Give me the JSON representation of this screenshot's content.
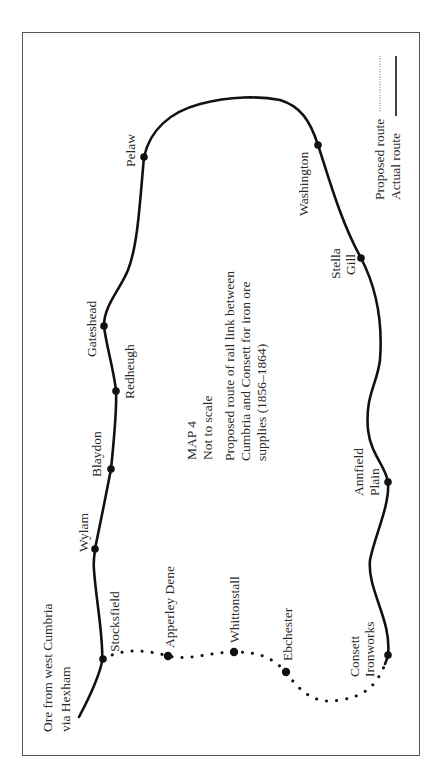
{
  "map": {
    "title": "MAP 4",
    "scale_note": "Not to scale",
    "caption_lines": [
      "Proposed route of rail link between",
      "Cumbria and Consett for iron ore",
      "supplies (1856–1864)"
    ],
    "origin_note_lines": [
      "Ore from west Cumbria",
      "via Hexham"
    ],
    "legend": {
      "proposed_label": "Proposed route",
      "actual_label": "Actual route"
    },
    "colors": {
      "route": "#111111",
      "frame": "#555555",
      "text": "#2a2a2a",
      "background": "#ffffff"
    },
    "stations": [
      {
        "name": "Stocksfield",
        "route": "actual/proposed junction"
      },
      {
        "name": "Wylam",
        "route": "actual"
      },
      {
        "name": "Blaydon",
        "route": "actual"
      },
      {
        "name": "Redheugh",
        "route": "actual"
      },
      {
        "name": "Gateshead",
        "route": "actual"
      },
      {
        "name": "Pelaw",
        "route": "actual"
      },
      {
        "name": "Washington",
        "route": "actual"
      },
      {
        "name": "Stella Gill",
        "route": "actual"
      },
      {
        "name": "Annfield Plain",
        "route": "actual"
      },
      {
        "name": "Consett Ironworks",
        "route": "actual/proposed junction"
      },
      {
        "name": "Apperley Dene",
        "route": "proposed"
      },
      {
        "name": "Whittonstall",
        "route": "proposed"
      },
      {
        "name": "Ebchester",
        "route": "proposed"
      }
    ],
    "labels": {
      "stocksfield": "Stocksfield",
      "wylam": "Wylam",
      "blaydon": "Blaydon",
      "redheugh": "Redheugh",
      "gateshead": "Gateshead",
      "pelaw": "Pelaw",
      "washington": "Washington",
      "stella_gill": [
        "Stella",
        "Gill"
      ],
      "annfield_plain": [
        "Annfield",
        "Plain"
      ],
      "consett_ironworks": [
        "Consett",
        "Ironworks"
      ],
      "apperley_dene": "Apperley Dene",
      "whittonstall": "Whittonstall",
      "ebchester": "Ebchester"
    }
  }
}
